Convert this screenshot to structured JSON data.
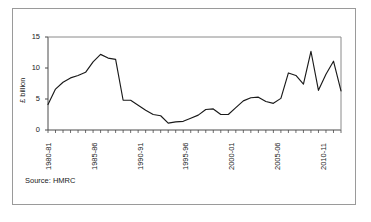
{
  "figure": {
    "source_note": "Source: HMRC",
    "axis_label_y": "£ billion",
    "frame_color": "#9a9a9a",
    "line_color": "#1a1a1a",
    "background": "#ffffff"
  },
  "chart_data": {
    "type": "line",
    "title": "",
    "subtitle": "",
    "xlabel": "",
    "ylabel": "£ billion",
    "ylim": [
      0,
      15
    ],
    "yticks": [
      0,
      5,
      10,
      15
    ],
    "ytick_labels": [
      "0",
      "5",
      "10",
      "15"
    ],
    "grid": false,
    "legend": false,
    "legend_position": "none",
    "annotations": [
      "Source: HMRC"
    ],
    "xtick_labels_shown": [
      "1980-81",
      "1985-86",
      "1990-91",
      "1995-96",
      "2000-01",
      "2005-06",
      "2010-11"
    ],
    "xtick_label_indices": [
      0,
      5,
      10,
      15,
      20,
      25,
      30
    ],
    "categories": [
      "1980-81",
      "1981-82",
      "1982-83",
      "1983-84",
      "1984-85",
      "1985-86",
      "1986-87",
      "1987-88",
      "1988-89",
      "1989-90",
      "1990-91",
      "1991-92",
      "1992-93",
      "1993-94",
      "1994-95",
      "1995-96",
      "1996-97",
      "1997-98",
      "1998-99",
      "1999-00",
      "2000-01",
      "2001-02",
      "2002-03",
      "2003-04",
      "2004-05",
      "2005-06",
      "2006-07",
      "2007-08",
      "2008-09",
      "2009-10",
      "2010-11",
      "2011-12",
      "2012-13"
    ],
    "series": [
      {
        "name": "Receipts",
        "values": [
          4.1,
          6.6,
          7.7,
          8.4,
          8.8,
          9.3,
          12.2,
          11.6,
          4.8,
          4.8,
          4.0,
          3.2,
          2.5,
          2.3,
          1.1,
          1.3,
          1.4,
          1.9,
          2.4,
          3.3,
          3.4,
          2.5,
          2.5,
          3.6,
          4.7,
          5.2,
          5.3,
          4.6,
          4.3,
          5.1,
          9.2,
          8.8,
          7.4
        ]
      }
    ],
    "values_extended": [
      4.1,
      6.6,
      7.7,
      8.4,
      8.8,
      9.3,
      12.2,
      11.6,
      4.8,
      4.8,
      4.0,
      3.2,
      2.5,
      2.3,
      1.1,
      1.3,
      1.4,
      1.9,
      2.4,
      3.3,
      3.4,
      2.5,
      2.5,
      3.6,
      4.7,
      5.2,
      5.3,
      4.6,
      4.3,
      5.1,
      9.2,
      8.8,
      7.4,
      12.7,
      6.4,
      9.0,
      11.1,
      6.3
    ],
    "series_points": [
      {
        "x": 0,
        "y": 4.1
      },
      {
        "x": 1,
        "y": 6.6
      },
      {
        "x": 2,
        "y": 7.7
      },
      {
        "x": 3,
        "y": 8.4
      },
      {
        "x": 4,
        "y": 8.8
      },
      {
        "x": 5,
        "y": 9.3
      },
      {
        "x": 6,
        "y": 11.0
      },
      {
        "x": 7,
        "y": 12.2
      },
      {
        "x": 8,
        "y": 11.6
      },
      {
        "x": 9,
        "y": 11.4
      },
      {
        "x": 10,
        "y": 4.8
      },
      {
        "x": 11,
        "y": 4.8
      },
      {
        "x": 12,
        "y": 4.0
      },
      {
        "x": 13,
        "y": 3.2
      },
      {
        "x": 14,
        "y": 2.5
      },
      {
        "x": 15,
        "y": 2.3
      },
      {
        "x": 16,
        "y": 1.1
      },
      {
        "x": 17,
        "y": 1.3
      },
      {
        "x": 18,
        "y": 1.4
      },
      {
        "x": 19,
        "y": 1.9
      },
      {
        "x": 20,
        "y": 2.4
      },
      {
        "x": 21,
        "y": 3.3
      },
      {
        "x": 22,
        "y": 3.4
      },
      {
        "x": 23,
        "y": 2.5
      },
      {
        "x": 24,
        "y": 2.5
      },
      {
        "x": 25,
        "y": 3.6
      },
      {
        "x": 26,
        "y": 4.7
      },
      {
        "x": 27,
        "y": 5.2
      },
      {
        "x": 28,
        "y": 5.3
      },
      {
        "x": 29,
        "y": 4.6
      },
      {
        "x": 30,
        "y": 4.3
      },
      {
        "x": 31,
        "y": 5.1
      },
      {
        "x": 32,
        "y": 9.2
      },
      {
        "x": 33,
        "y": 8.8
      },
      {
        "x": 34,
        "y": 7.4
      },
      {
        "x": 35,
        "y": 12.7
      },
      {
        "x": 36,
        "y": 6.4
      },
      {
        "x": 37,
        "y": 9.0
      },
      {
        "x": 38,
        "y": 11.1
      },
      {
        "x": 39,
        "y": 6.3
      }
    ]
  }
}
